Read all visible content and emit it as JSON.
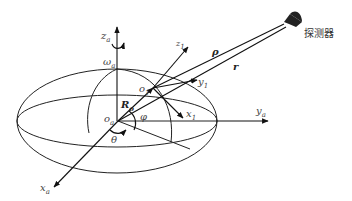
{
  "diagram": {
    "title": "",
    "labels": {
      "z_a": "z",
      "z_a_sub": "a",
      "omega_a": "ω",
      "omega_a_sub": "a",
      "z_1": "z",
      "z_1_sub": "1",
      "y_1": "y",
      "y_1_sub": "1",
      "x_1": "x",
      "x_1_sub": "1",
      "o_1": "o",
      "o_1_sub": "1",
      "o_a": "o",
      "o_a_sub": "a",
      "R_o": "R",
      "R_o_sub": "o",
      "phi": "φ",
      "theta": "θ",
      "x_a": "x",
      "x_a_sub": "a",
      "y_a": "y",
      "y_a_sub": "a",
      "rho": "ρ",
      "r": "r",
      "probe": "探测器"
    },
    "nodes": [
      {
        "id": "o_a",
        "label": "origin of asteroid frame"
      },
      {
        "id": "o_1",
        "label": "surface point frame origin"
      },
      {
        "id": "probe",
        "label": "探测器"
      }
    ],
    "edges": [
      {
        "from": "o_a",
        "to": "o_1",
        "label": "R_o"
      },
      {
        "from": "o_1",
        "to": "probe",
        "label": "ρ"
      },
      {
        "from": "o_a",
        "to": "probe",
        "label": "r"
      }
    ],
    "colors": {
      "stroke": "#222222",
      "label": "#444444"
    }
  }
}
